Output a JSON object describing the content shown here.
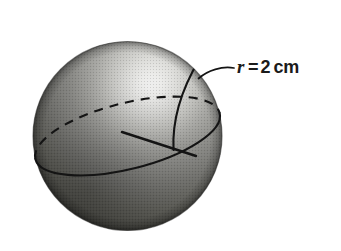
{
  "figure": {
    "name": "sphere-radius-diagram",
    "kind": "geometric-solid-illustration",
    "canvas": {
      "width": 341,
      "height": 251
    },
    "background_color": "#ffffff"
  },
  "sphere": {
    "name": "shaded-sphere",
    "center_x": 127,
    "center_y": 136,
    "radius_px": 95,
    "bounds": {
      "left": 33,
      "top": 35,
      "right": 222,
      "bottom": 237
    },
    "fill_style": "radial-gradient-halftone",
    "highlight_x": 150,
    "highlight_y": 85,
    "highlight_color": "#f2f2f0",
    "midtone_color": "#8d8d8b",
    "shadow_color": "#3a3a38",
    "rim_color": "#2a2a28"
  },
  "equator": {
    "name": "equator-ellipse",
    "back_half_style": "dashed",
    "front_half_style": "solid",
    "stroke_color": "#141414",
    "stroke_width": 2,
    "dash_pattern": "9 7",
    "tilt_degrees": -14
  },
  "radius_line": {
    "name": "radius-segment",
    "style": "solid",
    "stroke_color": "#141414",
    "stroke_width": 2.4,
    "start_x": 122,
    "start_y": 132,
    "end_x": 196,
    "end_y": 156
  },
  "meridian": {
    "name": "meridian-arc",
    "style": "solid",
    "stroke_color": "#141414",
    "stroke_width": 2.2
  },
  "leader_line": {
    "name": "label-leader-line",
    "style": "solid-curved",
    "stroke_color": "#141414",
    "stroke_width": 1.8,
    "from_x": 234,
    "from_y": 68,
    "to_x": 197,
    "to_y": 79
  },
  "label": {
    "name": "radius-label",
    "full_text": "r = 2 cm",
    "variable": "r",
    "equals": "=",
    "value": "2",
    "unit": "cm",
    "text_color": "#1b1b1b",
    "x": 237,
    "y": 57
  }
}
